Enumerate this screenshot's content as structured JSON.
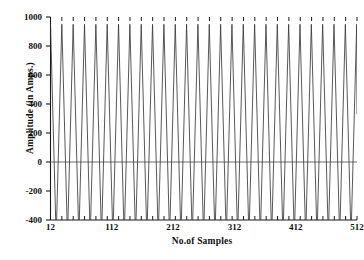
{
  "chart_data": {
    "type": "line",
    "title": "",
    "subtitle": "",
    "xlabel": "No.of Samples",
    "ylabel": "Amplitude (in Amps.)",
    "xlim": [
      12,
      512
    ],
    "ylim": [
      -400,
      1000
    ],
    "xticks": [
      12,
      112,
      212,
      312,
      412,
      512
    ],
    "xtick_labels": [
      "12",
      "112",
      "212",
      "312",
      "412",
      "512"
    ],
    "yticks": [
      -400,
      -200,
      0,
      200,
      400,
      600,
      800,
      1000
    ],
    "ytick_labels": [
      "-400",
      "-200",
      "0",
      "200",
      "400",
      "600",
      "800",
      "1000"
    ],
    "grid": false,
    "legend": null,
    "zero_line": true,
    "minor_xticks_count": 27,
    "series": [
      {
        "name": "Current waveform",
        "color": "#3a3a3a",
        "description": "High-frequency oscillating current waveform, approximately 27 sharp triangular cycles across 512 samples, peaks near +950 Amps and troughs clipped below -400 Amps.",
        "cycles": 27,
        "period_samples": 18.5,
        "peak_value": 950,
        "trough_value": -520,
        "start_value": 950,
        "end_value": 330,
        "waveform": "triangular"
      }
    ]
  },
  "axes": {
    "left_spine": true,
    "bottom_spine": true,
    "top_spine": false,
    "right_spine": false
  }
}
